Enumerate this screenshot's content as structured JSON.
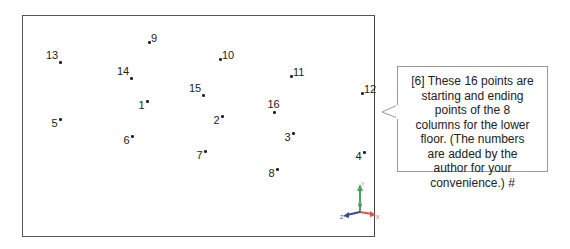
{
  "figure": {
    "points": [
      {
        "label": "1",
        "x": 147,
        "y": 101,
        "dx": 4,
        "dy": -2,
        "pos": "left"
      },
      {
        "label": "2",
        "x": 222,
        "y": 116,
        "dx": 2,
        "dy": -2,
        "pos": "left"
      },
      {
        "label": "3",
        "x": 293,
        "y": 133,
        "dx": 1,
        "dy": -2,
        "pos": "left"
      },
      {
        "label": "4",
        "x": 364,
        "y": 152,
        "dx": 1,
        "dy": -2,
        "pos": "left"
      },
      {
        "label": "5",
        "x": 60,
        "y": 119,
        "dx": 2,
        "dy": -2,
        "pos": "left"
      },
      {
        "label": "6",
        "x": 132,
        "y": 136,
        "dx": 1,
        "dy": -2,
        "pos": "left"
      },
      {
        "label": "7",
        "x": 205,
        "y": 151,
        "dx": 1,
        "dy": -2,
        "pos": "left"
      },
      {
        "label": "8",
        "x": 277,
        "y": 169,
        "dx": 1,
        "dy": -2,
        "pos": "left"
      },
      {
        "label": "9",
        "x": 149,
        "y": 42,
        "dx": 0,
        "dy": 0,
        "pos": "right"
      },
      {
        "label": "10",
        "x": 220,
        "y": 59,
        "dx": 0,
        "dy": 0,
        "pos": "right"
      },
      {
        "label": "11",
        "x": 291,
        "y": 76,
        "dx": 0,
        "dy": 0,
        "pos": "right"
      },
      {
        "label": "12",
        "x": 362,
        "y": 93,
        "dx": 0,
        "dy": 0,
        "pos": "right"
      },
      {
        "label": "13",
        "x": 60,
        "y": 62,
        "dx": 0,
        "dy": 0,
        "pos": "above-left"
      },
      {
        "label": "14",
        "x": 131,
        "y": 78,
        "dx": 0,
        "dy": 0,
        "pos": "above-left"
      },
      {
        "label": "15",
        "x": 203,
        "y": 95,
        "dx": 0,
        "dy": 0,
        "pos": "above-left"
      },
      {
        "label": "16",
        "x": 274,
        "y": 112,
        "dx": 0,
        "dy": 0,
        "pos": "above"
      }
    ],
    "triad": {
      "x_label": "X",
      "y_label": "Y",
      "z_label": "Z",
      "colors": {
        "x": "#d9574a",
        "y": "#4aa35c",
        "z": "#3a4a9a"
      }
    }
  },
  "callout": {
    "text": "[6] These 16 points are starting and ending points of the 8 columns for the lower floor.  (The numbers are added by the author for your convenience.) #",
    "lines": [
      "[6] These 16 points are",
      "starting and ending",
      "points of the 8",
      "columns for the lower",
      "floor.  (The numbers",
      "are added by the",
      "author for your",
      "convenience.) #"
    ]
  }
}
